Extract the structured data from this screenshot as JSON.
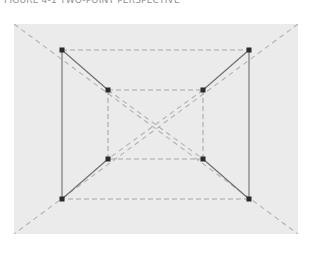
{
  "caption": {
    "text": "FIGURE 4-1  TWO-POINT PERSPECTIVE"
  },
  "figure": {
    "panel": {
      "x": 14,
      "y": 24,
      "width": 284,
      "height": 210,
      "background_color": "#ebebeb"
    },
    "colors": {
      "panel_background": "#ebebeb",
      "page_background": "#ffffff",
      "solid_edge": "#6e6e6e",
      "dashed_edge": "#a8a8a8",
      "diagonal_guide": "#b2b2b2",
      "vertex_marker": "#2b2b2b",
      "caption_text": "#8e8e8e"
    },
    "geometry": {
      "front_face_label": "outer-rectangle",
      "back_face_label": "inner-rectangle",
      "front_face": {
        "top_left": [
          48,
          26
        ],
        "top_right": [
          235,
          26
        ],
        "bottom_right": [
          235,
          175
        ],
        "bottom_left": [
          48,
          175
        ]
      },
      "back_face": {
        "top_left": [
          94,
          66
        ],
        "top_right": [
          189,
          66
        ],
        "bottom_right": [
          189,
          135
        ],
        "bottom_left": [
          94,
          135
        ]
      },
      "vanishing_point": [
        141,
        100
      ],
      "panel_corners": {
        "top_left": [
          0,
          0
        ],
        "top_right": [
          284,
          0
        ],
        "bottom_right": [
          284,
          210
        ],
        "bottom_left": [
          0,
          210
        ]
      },
      "vertex_count": 8,
      "vertex_marker_size": 5
    },
    "line_styles": {
      "solid_width": 1.1,
      "dashed_width": 1.1,
      "dash_pattern": "5,3",
      "guide_dash_pattern": "5,4"
    }
  }
}
